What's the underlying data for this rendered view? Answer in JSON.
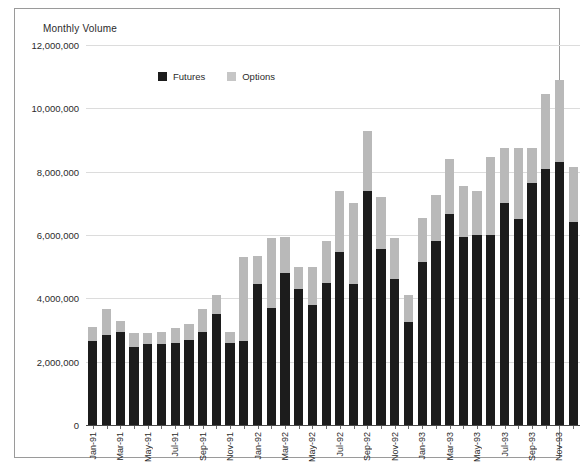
{
  "chart_title": "Monthly Volume",
  "legend": {
    "position": "top-center",
    "items": [
      {
        "label": "Futures",
        "color": "#1c1c1c",
        "swatch": "futures-swatch"
      },
      {
        "label": "Options",
        "color": "#c6c6c6",
        "swatch": "options-swatch"
      }
    ]
  },
  "axis": {
    "y_ticks": [
      "12,000,000",
      "10,000,000",
      "8,000,000",
      "6,000,000",
      "4,000,000",
      "2,000,000",
      "0"
    ],
    "y_tick_values": [
      12000000,
      10000000,
      8000000,
      6000000,
      4000000,
      2000000,
      0
    ]
  },
  "chart_data": {
    "type": "bar",
    "stacked": true,
    "title": "Monthly Volume",
    "xlabel": "",
    "ylabel": "",
    "ylim": [
      0,
      12000000
    ],
    "ytick_step": 2000000,
    "grid": true,
    "legend_position": "top-center",
    "categories": [
      "Jan-91",
      "Feb-91",
      "Mar-91",
      "Apr-91",
      "May-91",
      "Jun-91",
      "Jul-91",
      "Aug-91",
      "Sep-91",
      "Oct-91",
      "Nov-91",
      "Dec-91",
      "Jan-92",
      "Feb-92",
      "Mar-92",
      "Apr-92",
      "May-92",
      "Jun-92",
      "Jul-92",
      "Aug-92",
      "Sep-92",
      "Oct-92",
      "Nov-92",
      "Dec-92",
      "Jan-93",
      "Feb-93",
      "Mar-93",
      "Apr-93",
      "May-93",
      "Jun-93",
      "Jul-93",
      "Aug-93",
      "Sep-93",
      "Oct-93",
      "Nov-93",
      "Dec-93"
    ],
    "tick_labels_shown": [
      "Jan-91",
      "Mar-91",
      "May-91",
      "Jul-91",
      "Sep-91",
      "Nov-91",
      "Jan-92",
      "Mar-92",
      "May-92",
      "Jul-92",
      "Sep-92",
      "Nov-92",
      "Jan-93",
      "Mar-93",
      "May-93",
      "Jul-93",
      "Sep-93",
      "Nov-93"
    ],
    "series": [
      {
        "name": "Futures",
        "color": "#1c1c1c",
        "values": [
          2650000,
          2850000,
          2950000,
          2450000,
          2550000,
          2550000,
          2600000,
          2700000,
          2950000,
          3500000,
          2600000,
          2650000,
          4450000,
          3700000,
          4800000,
          4300000,
          3800000,
          4500000,
          5450000,
          4450000,
          7400000,
          5550000,
          4600000,
          3250000,
          5150000,
          5800000,
          6650000,
          5950000,
          6000000,
          6000000,
          7000000,
          6500000,
          7650000,
          8100000,
          8300000,
          6400000
        ]
      },
      {
        "name": "Options",
        "color": "#b9b9b9",
        "values": [
          450000,
          800000,
          350000,
          450000,
          350000,
          400000,
          450000,
          500000,
          700000,
          600000,
          350000,
          2650000,
          900000,
          2200000,
          1150000,
          700000,
          1200000,
          1300000,
          1950000,
          2550000,
          1900000,
          1650000,
          1300000,
          850000,
          1400000,
          1450000,
          1750000,
          1600000,
          1400000,
          2450000,
          1750000,
          2250000,
          1100000,
          2350000,
          2600000,
          1750000
        ]
      }
    ],
    "totals": [
      3100000,
      3650000,
      3300000,
      2900000,
      2900000,
      2950000,
      3050000,
      3200000,
      3650000,
      4100000,
      2950000,
      5300000,
      5350000,
      5900000,
      5950000,
      5000000,
      5000000,
      5800000,
      7400000,
      7000000,
      9300000,
      7200000,
      5900000,
      4100000,
      6550000,
      7250000,
      8400000,
      7550000,
      7400000,
      8450000,
      8750000,
      8750000,
      8750000,
      10450000,
      10900000,
      8150000
    ]
  }
}
